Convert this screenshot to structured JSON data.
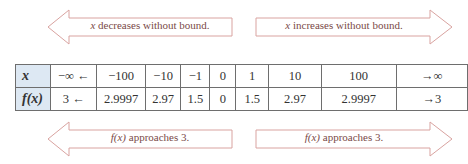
{
  "top_arrows": {
    "left": {
      "var": "x",
      "text": " decreases without bound.",
      "direction": "left"
    },
    "right": {
      "var": "x",
      "text": " increases without bound.",
      "direction": "right"
    }
  },
  "bottom_arrows": {
    "left": {
      "var": "f(x)",
      "text": " approaches 3.",
      "direction": "left"
    },
    "right": {
      "var": "f(x)",
      "text": " approaches 3.",
      "direction": "right"
    }
  },
  "table": {
    "rows": [
      {
        "header": "x",
        "cells": [
          "−∞ ←",
          "−100",
          "−10",
          "−1",
          "0",
          "1",
          "10",
          "100",
          "→∞"
        ]
      },
      {
        "header": "f(x)",
        "cells": [
          "3 ←",
          "2.9997",
          "2.97",
          "1.5",
          "0",
          "1.5",
          "2.97",
          "2.9997",
          "→3"
        ]
      }
    ],
    "column_widths": [
      37,
      56,
      53,
      39,
      33,
      32,
      38,
      63,
      89
    ]
  },
  "colors": {
    "arrow_stroke": "#d9a3a0",
    "arrow_text": "#7a4a48",
    "header_fill": "#dde8f3",
    "grid": "#6e6e6e"
  }
}
